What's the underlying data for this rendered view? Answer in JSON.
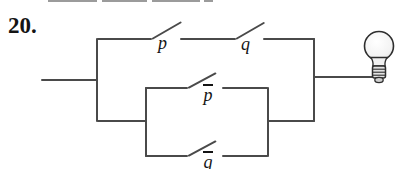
{
  "theme": {
    "wire": "#4a4a4a",
    "label": "#141414",
    "background": "#ffffff",
    "remnant": "#9b9b9b"
  },
  "problem": {
    "number_label": "20."
  },
  "circuit": {
    "switches": [
      {
        "id": "p",
        "label": "p",
        "negated": false,
        "branch": "top-series-1"
      },
      {
        "id": "q",
        "label": "q",
        "negated": false,
        "branch": "top-series-2"
      },
      {
        "id": "not-p",
        "label": "p",
        "negated": true,
        "branch": "parallel-upper"
      },
      {
        "id": "not-q",
        "label": "q",
        "negated": true,
        "branch": "parallel-lower"
      }
    ],
    "lamp": "light-bulb"
  }
}
